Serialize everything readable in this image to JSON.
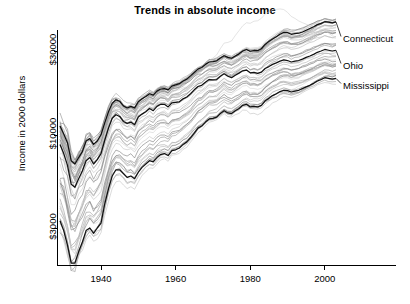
{
  "chart_data": {
    "type": "line",
    "title": "Trends in absolute income",
    "xlabel": "",
    "ylabel": "Income in 2000 dollars",
    "yscale": "log",
    "ylim": [
      2000,
      45000
    ],
    "xlim": [
      1929,
      2003
    ],
    "grid": false,
    "legend_position": "right-inline",
    "y_ticks": [
      3000,
      10000,
      30000
    ],
    "y_tick_labels": [
      "$3000",
      "$10000",
      "$30000"
    ],
    "x_ticks": [
      1940,
      1960,
      1980,
      2000
    ],
    "x_tick_labels": [
      "1940",
      "1960",
      "1980",
      "2000"
    ],
    "n_series": 51,
    "highlighted_series": [
      "Connecticut",
      "Ohio",
      "Mississippi"
    ],
    "annotations": [
      {
        "text": "Connecticut",
        "x": 2003,
        "y": 37000
      },
      {
        "text": "Ohio",
        "x": 2003,
        "y": 27000
      },
      {
        "text": "Mississippi",
        "x": 2003,
        "y": 21500
      }
    ],
    "x": [
      1929,
      1930,
      1931,
      1932,
      1933,
      1934,
      1935,
      1936,
      1937,
      1938,
      1939,
      1940,
      1941,
      1942,
      1943,
      1944,
      1945,
      1946,
      1947,
      1948,
      1949,
      1950,
      1951,
      1952,
      1953,
      1954,
      1955,
      1956,
      1957,
      1958,
      1959,
      1960,
      1961,
      1962,
      1963,
      1964,
      1965,
      1966,
      1967,
      1968,
      1969,
      1970,
      1971,
      1972,
      1973,
      1974,
      1975,
      1976,
      1977,
      1978,
      1979,
      1980,
      1981,
      1982,
      1983,
      1984,
      1985,
      1986,
      1987,
      1988,
      1989,
      1990,
      1991,
      1992,
      1993,
      1994,
      1995,
      1996,
      1997,
      1998,
      1999,
      2000,
      2001,
      2002,
      2003
    ],
    "series": [
      {
        "name": "Connecticut",
        "highlight": true,
        "color": "#111111",
        "values": [
          11300,
          10200,
          9100,
          7200,
          6900,
          7500,
          8100,
          9300,
          9600,
          8900,
          9300,
          10100,
          11800,
          13600,
          15200,
          15900,
          15600,
          14700,
          14300,
          14600,
          14300,
          15500,
          16100,
          16600,
          17200,
          16900,
          17800,
          18300,
          18400,
          18100,
          19000,
          19300,
          19600,
          20300,
          20800,
          21700,
          22700,
          23700,
          24200,
          25200,
          26000,
          26100,
          26400,
          27400,
          28200,
          27600,
          27300,
          28100,
          28900,
          30000,
          30600,
          29900,
          30200,
          30100,
          30900,
          32700,
          33900,
          35100,
          36100,
          37300,
          38200,
          38100,
          37300,
          37600,
          37800,
          38400,
          39300,
          40200,
          41100,
          42300,
          43000,
          43900,
          43700,
          43300,
          43800
        ]
      },
      {
        "name": "Ohio",
        "highlight": true,
        "color": "#111111",
        "values": [
          8900,
          7900,
          6800,
          5300,
          5100,
          5700,
          6300,
          7200,
          7500,
          6900,
          7300,
          7900,
          9400,
          11000,
          12500,
          13100,
          12800,
          12000,
          11700,
          11900,
          11500,
          12700,
          13200,
          13600,
          14200,
          13800,
          14600,
          15000,
          15000,
          14500,
          15300,
          15400,
          15500,
          16100,
          16500,
          17200,
          18100,
          18900,
          19200,
          20000,
          20700,
          20600,
          20700,
          21600,
          22300,
          21600,
          21200,
          21900,
          22500,
          23200,
          23400,
          22600,
          22700,
          22400,
          22800,
          23900,
          24500,
          25200,
          25700,
          26300,
          26700,
          26500,
          26000,
          26300,
          26500,
          27000,
          27600,
          28100,
          28700,
          29500,
          30000,
          30600,
          30300,
          30000,
          30300
        ]
      },
      {
        "name": "Mississippi",
        "highlight": true,
        "color": "#111111",
        "values": [
          3300,
          2900,
          2400,
          1900,
          1900,
          2200,
          2500,
          2900,
          3000,
          2800,
          3000,
          3200,
          4100,
          5000,
          5900,
          6400,
          6400,
          6100,
          5800,
          5900,
          5700,
          6200,
          6600,
          6900,
          7200,
          7100,
          7500,
          7800,
          7900,
          7700,
          8200,
          8300,
          8500,
          8900,
          9200,
          9700,
          10300,
          11000,
          11300,
          11900,
          12400,
          12500,
          12700,
          13300,
          13800,
          13400,
          13300,
          13800,
          14200,
          14800,
          15000,
          14500,
          14600,
          14500,
          14800,
          15700,
          16200,
          16800,
          17200,
          17700,
          18000,
          17900,
          17600,
          17800,
          18000,
          18400,
          18800,
          19200,
          19700,
          20300,
          20700,
          21200,
          21000,
          20800,
          21000
        ]
      }
    ]
  }
}
